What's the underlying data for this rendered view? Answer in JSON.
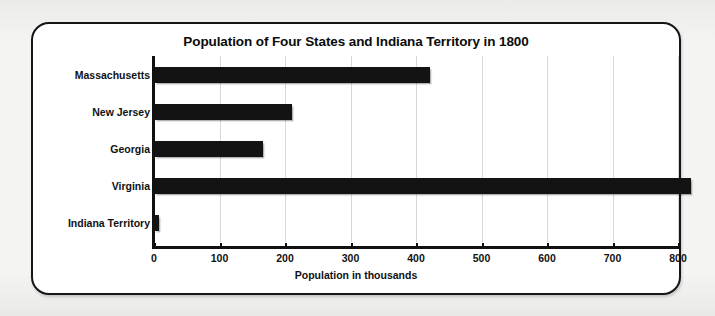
{
  "chart_data": {
    "type": "bar",
    "orientation": "horizontal",
    "title": "Population of Four States and Indiana Territory in 1800",
    "xlabel": "Population in thousands",
    "ylabel": "",
    "categories": [
      "Massachusetts",
      "New Jersey",
      "Georgia",
      "Virginia",
      "Indiana Territory"
    ],
    "values": [
      422,
      211,
      166,
      820,
      8
    ],
    "xlim": [
      0,
      800
    ],
    "xticks": [
      0,
      100,
      200,
      300,
      400,
      500,
      600,
      700,
      800
    ],
    "xtick_labels": [
      "0",
      "100",
      "200",
      "300",
      "400",
      "500",
      "600",
      "700",
      "800"
    ],
    "grid": true,
    "grid_axis": "x",
    "legend": false,
    "bar_color": "#131313",
    "background_color": "#ffffff",
    "frame_color": "#161616"
  }
}
